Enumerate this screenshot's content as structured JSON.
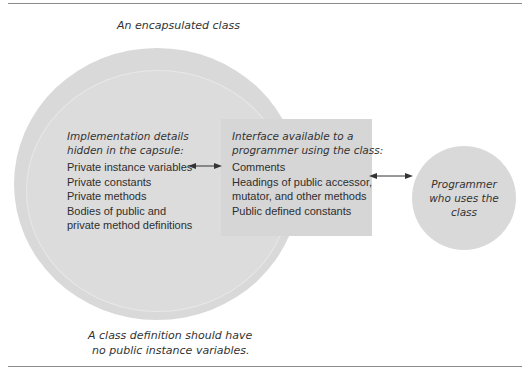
{
  "diagram": {
    "title": "An encapsulated class",
    "implementation": {
      "title_line1": "Implementation details",
      "title_line2": "hidden in the capsule:",
      "items": [
        "Private instance variables",
        "Private constants",
        "Private methods",
        "Bodies of public and",
        "private method definitions"
      ]
    },
    "interface": {
      "title_line1": "Interface available to a",
      "title_line2": "programmer using the class:",
      "items": [
        "Comments",
        "Headings of public accessor,",
        "mutator, and other methods",
        "Public defined constants"
      ]
    },
    "programmer": {
      "label": "Programmer who uses the class"
    },
    "caption": {
      "line1": "A class definition should have",
      "line2": "no public instance variables."
    },
    "colors": {
      "shape_fill": "#d9d9d9",
      "arrow": "#333333",
      "rule": "#8a8a8a"
    }
  }
}
